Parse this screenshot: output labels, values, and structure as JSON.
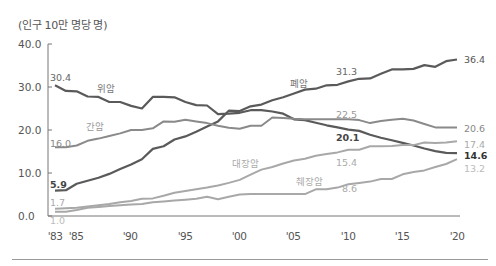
{
  "chart_data": {
    "type": "line",
    "title": "",
    "unit_label": "(인구 10만 명당 명)",
    "xlabel": "",
    "ylabel": "(인구 10만 명당 명)",
    "ylim": [
      0,
      40
    ],
    "y_ticks": [
      "40.0",
      "30.0",
      "20.0",
      "10.0",
      "0.0"
    ],
    "x_ticks": [
      "'83",
      "'85",
      "'90",
      "'95",
      "'00",
      "'05",
      "'10",
      "'15",
      "'20"
    ],
    "x": [
      1983,
      1984,
      1985,
      1986,
      1987,
      1988,
      1989,
      1990,
      1991,
      1992,
      1993,
      1994,
      1995,
      1996,
      1997,
      1998,
      1999,
      2000,
      2001,
      2002,
      2003,
      2004,
      2005,
      2006,
      2007,
      2008,
      2009,
      2010,
      2011,
      2012,
      2013,
      2014,
      2015,
      2016,
      2017,
      2018,
      2019,
      2020
    ],
    "grid": false,
    "series": [
      {
        "name": "폐암",
        "color": "#5a5a5a",
        "values": [
          5.9,
          6.0,
          7.5,
          8.2,
          8.9,
          9.8,
          10.9,
          12.0,
          13.2,
          15.6,
          16.2,
          17.8,
          18.5,
          19.6,
          20.8,
          22.0,
          24.5,
          24.4,
          25.5,
          25.9,
          26.9,
          27.6,
          28.5,
          29.4,
          29.6,
          30.4,
          30.5,
          31.3,
          31.9,
          32.0,
          33.1,
          34.1,
          34.1,
          34.2,
          35.1,
          34.7,
          36.0,
          36.4
        ],
        "labels": {
          "start": "5.9",
          "2010": "31.3",
          "end": "36.4"
        }
      },
      {
        "name": "위암",
        "color": "#5a5a5a",
        "values": [
          30.4,
          29.1,
          29.0,
          27.8,
          27.7,
          26.5,
          26.5,
          25.6,
          25.0,
          27.7,
          27.7,
          27.6,
          26.5,
          25.8,
          25.7,
          23.7,
          23.8,
          24.0,
          24.6,
          24.6,
          24.3,
          23.8,
          22.5,
          22.3,
          21.7,
          21.1,
          20.6,
          20.1,
          19.8,
          18.9,
          18.2,
          17.6,
          17.0,
          16.4,
          15.7,
          15.1,
          14.7,
          14.6
        ],
        "labels": {
          "start": "30.4",
          "2010": "20.1",
          "end": "14.6"
        }
      },
      {
        "name": "간암",
        "color": "#8a8a8a",
        "values": [
          16.0,
          16.0,
          16.4,
          17.5,
          18.0,
          18.6,
          19.2,
          20.0,
          20.0,
          20.4,
          22.0,
          21.9,
          22.4,
          22.0,
          21.6,
          21.0,
          20.5,
          20.3,
          21.0,
          21.0,
          22.9,
          22.8,
          22.6,
          22.5,
          22.5,
          22.5,
          22.5,
          22.5,
          22.3,
          21.6,
          22.1,
          22.4,
          22.6,
          22.2,
          21.4,
          20.6,
          20.6,
          20.6
        ],
        "labels": {
          "start": "16.0",
          "2010": "22.5",
          "end": "20.6"
        }
      },
      {
        "name": "대장암",
        "color": "#a8a8a8",
        "values": [
          1.7,
          1.8,
          1.9,
          2.2,
          2.5,
          2.8,
          3.2,
          3.5,
          4.0,
          4.1,
          4.7,
          5.4,
          5.8,
          6.2,
          6.6,
          7.1,
          7.7,
          8.4,
          9.6,
          10.8,
          11.4,
          12.2,
          12.9,
          13.3,
          14.0,
          14.4,
          14.8,
          15.4,
          15.4,
          16.2,
          16.2,
          16.3,
          16.5,
          16.5,
          17.1,
          17.0,
          17.1,
          17.4
        ],
        "labels": {
          "start": "1.7",
          "2010": "15.4",
          "end": "17.4"
        }
      },
      {
        "name": "췌장암",
        "color": "#a8a8a8",
        "values": [
          1.0,
          1.0,
          1.4,
          1.9,
          2.1,
          2.3,
          2.5,
          2.7,
          2.8,
          3.2,
          3.4,
          3.6,
          3.8,
          4.0,
          4.5,
          3.9,
          4.5,
          5.0,
          5.1,
          5.1,
          5.1,
          5.1,
          5.1,
          5.1,
          6.2,
          6.2,
          6.6,
          7.4,
          7.7,
          8.0,
          8.6,
          8.6,
          9.7,
          10.2,
          10.6,
          11.4,
          12.1,
          13.2
        ],
        "labels": {
          "start": "1.0",
          "2010": "8.6",
          "end": "13.2"
        }
      }
    ],
    "inline_labels": [
      {
        "text": "위암",
        "series": "위암"
      },
      {
        "text": "간암",
        "series": "간암"
      },
      {
        "text": "폐암",
        "series": "폐암"
      },
      {
        "text": "대장암",
        "series": "대장암"
      },
      {
        "text": "췌장암",
        "series": "췌장암"
      }
    ]
  }
}
